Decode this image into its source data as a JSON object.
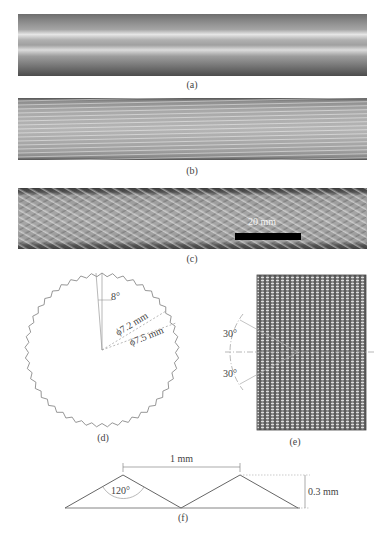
{
  "panels": {
    "a": {
      "caption": "(a)",
      "description": "smooth tube photograph"
    },
    "b": {
      "caption": "(b)",
      "description": "axially grooved tube photograph"
    },
    "c": {
      "caption": "(c)",
      "description": "cross-knurled tube photograph",
      "scale_bar_label": "20 mm"
    },
    "d": {
      "caption": "(d)",
      "angle_label": "8°",
      "inner_diameter_label": "ϕ7.2 mm",
      "outer_diameter_label": "ϕ7.5 mm",
      "teeth_count": 45
    },
    "e": {
      "caption": "(e)",
      "upper_angle_label": "30°",
      "lower_angle_label": "30°"
    },
    "f": {
      "caption": "(f)",
      "pitch_label": "1 mm",
      "height_label": "0.3 mm",
      "apex_angle_label": "120°"
    }
  },
  "colors": {
    "line": "#777777",
    "dashed": "#999999",
    "mesh_dark": "#555555",
    "mesh_light": "#d8d8d8"
  }
}
